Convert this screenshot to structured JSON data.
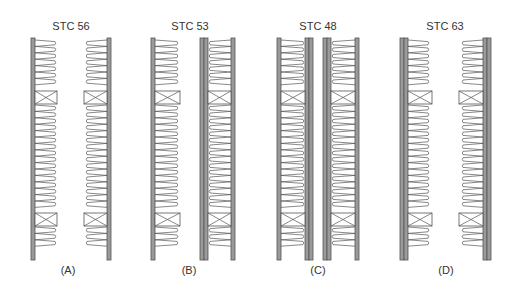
{
  "colors": {
    "board_fill": "#9a9a9a",
    "board_stroke": "#555555",
    "line": "#555555",
    "text": "#333333",
    "background": "#ffffff"
  },
  "panels": [
    {
      "id": "A",
      "title": "STC 56",
      "caption": "(A)",
      "center_x": 71,
      "description": "Staggered/double stud wall, single board each side, insulation on both sides"
    },
    {
      "id": "B",
      "title": "STC 53",
      "caption": "(B)",
      "center_x": 190,
      "description": "Double stud wall, one board left, double board at center, one board right"
    },
    {
      "id": "C",
      "title": "STC 48",
      "caption": "(C)",
      "center_x": 318,
      "description": "Two stud walls each with double inner boards and single outer board"
    },
    {
      "id": "D",
      "title": "STC 63",
      "caption": "(D)",
      "center_x": 444,
      "description": "Double stud wall with thick double boards on outer faces, large air gap"
    }
  ]
}
